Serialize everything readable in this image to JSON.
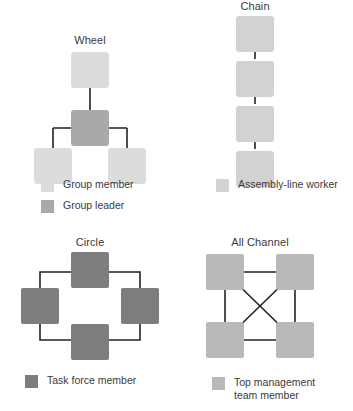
{
  "figure": {
    "background_color": "#ffffff",
    "text_color": "#3a3a3a",
    "line_color": "#222222"
  },
  "colors": {
    "group_member": "#dcdcdc",
    "group_leader": "#a9a9a9",
    "assembly_line_worker": "#d2d2d2",
    "task_force_member": "#7d7d7d",
    "top_management_team_member": "#b9b9b9"
  },
  "panels": [
    {
      "id": "wheel",
      "title": "Wheel",
      "node_count": 4,
      "legend": [
        {
          "label": "Group member",
          "color_key": "group_member"
        },
        {
          "label": "Group leader",
          "color_key": "group_leader"
        }
      ]
    },
    {
      "id": "chain",
      "title": "Chain",
      "node_count": 4,
      "legend": [
        {
          "label": "Assembly-line worker",
          "color_key": "assembly_line_worker"
        }
      ]
    },
    {
      "id": "circle",
      "title": "Circle",
      "node_count": 4,
      "legend": [
        {
          "label": "Task force member",
          "color_key": "task_force_member"
        }
      ]
    },
    {
      "id": "all-channel",
      "title": "All Channel",
      "node_count": 4,
      "legend": [
        {
          "label": "Top management\nteam member",
          "color_key": "top_management_team_member"
        }
      ]
    }
  ]
}
